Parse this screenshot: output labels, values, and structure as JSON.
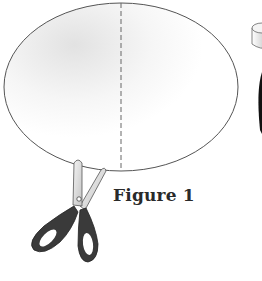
{
  "figure": {
    "caption": "Figure 1",
    "elements": [
      {
        "type": "ellipse",
        "description": "paper oval with a vertical dashed fold line through its center"
      },
      {
        "type": "dashed-line",
        "description": "vertical fold line"
      },
      {
        "type": "scissors",
        "description": "scissors with dark handles cutting at the bottom edge of the oval"
      },
      {
        "type": "cylinder",
        "description": "partially visible cylindrical object at the right edge"
      }
    ]
  },
  "colors": {
    "outline": "#555555",
    "dash": "#666666",
    "scissor_handle": "#3a3a3a",
    "scissor_blade": "#d8d8d8",
    "caption": "#2a2a2a"
  }
}
